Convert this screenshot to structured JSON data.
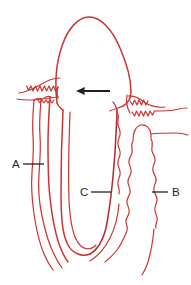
{
  "figure": {
    "background_color": "#ffffff",
    "line_color": "#cc3333",
    "line_color_dark": "#b5272f",
    "label_color": "#231f20",
    "arrow_color": "#231f20",
    "width": 191,
    "height": 285
  },
  "labels": [
    {
      "id": "A",
      "text": "A",
      "x": 12,
      "y": 168,
      "leader": {
        "x1": 23,
        "y1": 164,
        "x2": 44,
        "y2": 164
      },
      "describes": "left bone / periodontal ligament lines"
    },
    {
      "id": "C",
      "text": "C",
      "x": 80,
      "y": 196,
      "leader": {
        "x1": 91,
        "y1": 192,
        "x2": 110,
        "y2": 192
      },
      "describes": "tooth root surface"
    },
    {
      "id": "B",
      "text": "B",
      "x": 172,
      "y": 196,
      "leader": {
        "x1": 155,
        "y1": 192,
        "x2": 168,
        "y2": 192
      },
      "describes": "right alveolar bone crest"
    }
  ],
  "arrow": {
    "name": "pointer-arrow",
    "direction": "left",
    "tail_x": 110,
    "tip_x": 77,
    "y": 91,
    "color": "#231f20"
  },
  "structures": [
    {
      "name": "tooth-crown-and-root",
      "color": "#cc3333"
    },
    {
      "name": "left-gingival-margin",
      "color": "#cc3333"
    },
    {
      "name": "right-gingival-margin",
      "color": "#cc3333"
    },
    {
      "name": "left-bone-lines",
      "color": "#cc3333"
    },
    {
      "name": "right-bone-outline",
      "color": "#cc3333"
    },
    {
      "name": "periodontal-ligament-space",
      "color": "#cc3333"
    }
  ]
}
